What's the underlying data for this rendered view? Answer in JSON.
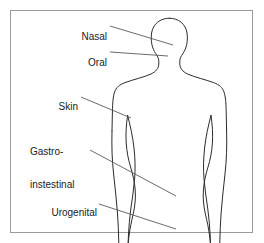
{
  "figure": {
    "kind": "anatomical-diagram",
    "background_color": "#ffffff",
    "frame": {
      "border_color": "#9a9a9a",
      "border_width": 1,
      "x": 10,
      "y": 10,
      "width": 243,
      "height": 223
    },
    "outline": {
      "stroke_color": "#2b2b2b",
      "fill": "none",
      "stroke_width": 1
    },
    "leader_lines": {
      "stroke_color": "#5a5a5a",
      "stroke_width": 0.9
    },
    "text_color": "#1a1a1a",
    "font_size_px": 10
  },
  "labels": [
    {
      "id": "nasal",
      "text": "Nasal",
      "text_x": 107,
      "text_y": 20,
      "anchor": "end",
      "leader": {
        "x1": 110,
        "y1": 26,
        "x2": 173,
        "y2": 45
      }
    },
    {
      "id": "oral",
      "text": "Oral",
      "text_x": 107,
      "text_y": 46,
      "anchor": "end",
      "leader": {
        "x1": 110,
        "y1": 52,
        "x2": 168,
        "y2": 56
      }
    },
    {
      "id": "skin",
      "text": "Skin",
      "text_x": 78,
      "text_y": 90,
      "anchor": "end",
      "leader": {
        "x1": 81,
        "y1": 97,
        "x2": 131,
        "y2": 118
      }
    },
    {
      "id": "gastrointestinal",
      "text_line_1": "Gastro-",
      "text_line_2": "instestinal",
      "text_x": 88,
      "text_y": 124,
      "anchor": "end",
      "leader": {
        "x1": 90,
        "y1": 150,
        "x2": 176,
        "y2": 196
      }
    },
    {
      "id": "urogenital",
      "text": "Urogenital",
      "text_x": 97,
      "text_y": 196,
      "anchor": "end",
      "leader": {
        "x1": 99,
        "y1": 204,
        "x2": 176,
        "y2": 229
      }
    }
  ]
}
